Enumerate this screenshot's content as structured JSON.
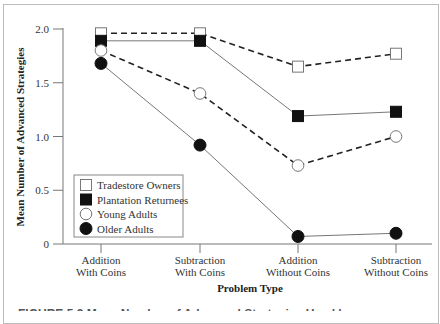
{
  "chart_data": {
    "type": "line",
    "title": "",
    "xlabel": "Problem Type",
    "ylabel": "Mean Number of Advanced Strategies",
    "ylim": [
      0,
      2.0
    ],
    "yticks": [
      {
        "value": 0,
        "label": "0"
      },
      {
        "value": 0.5,
        "label": "0.5"
      },
      {
        "value": 1.0,
        "label": "1.0"
      },
      {
        "value": 1.5,
        "label": "1.5"
      },
      {
        "value": 2.0,
        "label": "2.0"
      }
    ],
    "categories": [
      [
        "Addition",
        "With Coins"
      ],
      [
        "Subtraction",
        "With Coins"
      ],
      [
        "Addition",
        "Without Coins"
      ],
      [
        "Subtraction",
        "Without Coins"
      ]
    ],
    "grid": false,
    "legend_position": "bottom-left",
    "series": [
      {
        "name": "Tradestore Owners",
        "marker": "open-square",
        "line": "dashed",
        "values": [
          1.96,
          1.96,
          1.65,
          1.77
        ]
      },
      {
        "name": "Plantation Returnees",
        "marker": "filled-square",
        "line": "solid",
        "values": [
          1.89,
          1.89,
          1.19,
          1.23
        ]
      },
      {
        "name": "Young Adults",
        "marker": "open-circle",
        "line": "dashed",
        "values": [
          1.8,
          1.4,
          0.73,
          1.0
        ]
      },
      {
        "name": "Older Adults",
        "marker": "filled-circle",
        "line": "solid",
        "values": [
          1.68,
          0.92,
          0.07,
          0.1
        ]
      }
    ],
    "caption_partial": "FIGURE 5.3 Mean Number of Advanced Strategies Used by"
  }
}
